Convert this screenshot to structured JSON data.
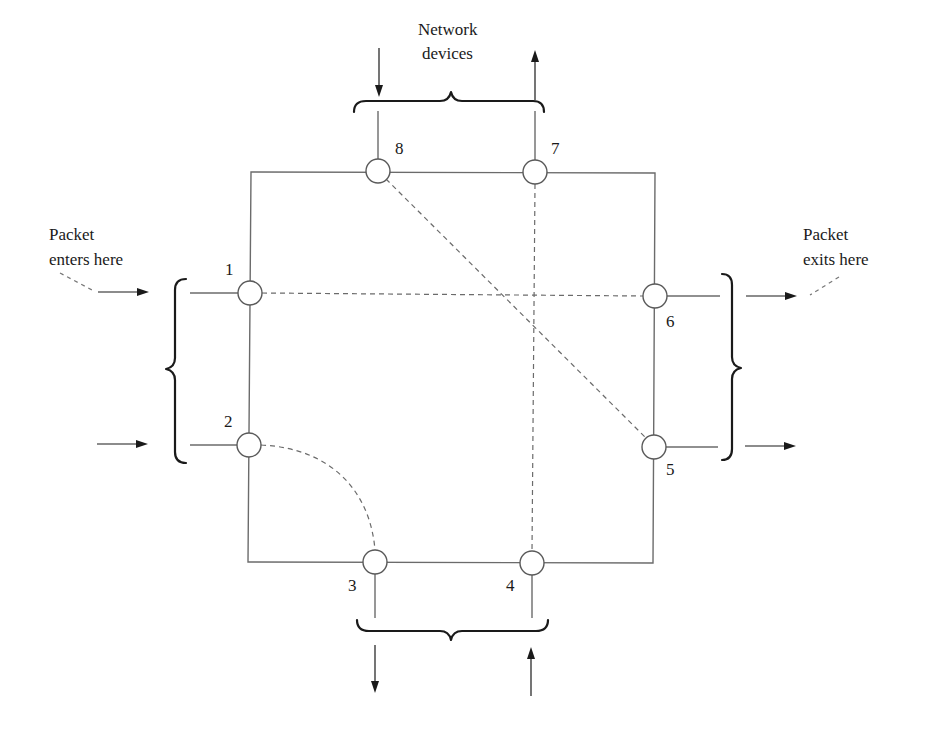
{
  "diagram": {
    "type": "network-routing-square",
    "labels": {
      "top_caption_line1": "Network",
      "top_caption_line2": "devices",
      "enter_line1": "Packet",
      "enter_line2": "enters here",
      "exit_line1": "Packet",
      "exit_line2": "exits here"
    },
    "nodes": [
      {
        "id": "1",
        "label": "1",
        "side": "left",
        "role": "input"
      },
      {
        "id": "2",
        "label": "2",
        "side": "left",
        "role": "input"
      },
      {
        "id": "3",
        "label": "3",
        "side": "bottom",
        "role": "output"
      },
      {
        "id": "4",
        "label": "4",
        "side": "bottom",
        "role": "input"
      },
      {
        "id": "5",
        "label": "5",
        "side": "right",
        "role": "output"
      },
      {
        "id": "6",
        "label": "6",
        "side": "right",
        "role": "output"
      },
      {
        "id": "7",
        "label": "7",
        "side": "top",
        "role": "output"
      },
      {
        "id": "8",
        "label": "8",
        "side": "top",
        "role": "input"
      }
    ],
    "dashed_routes": [
      {
        "from": "1",
        "to": "6",
        "shape": "straight"
      },
      {
        "from": "8",
        "to": "5",
        "shape": "straight"
      },
      {
        "from": "7",
        "to": "4",
        "shape": "straight"
      },
      {
        "from": "2",
        "to": "3",
        "shape": "curve"
      }
    ],
    "colors": {
      "wire": "#6b6b6b",
      "brace": "#1a1a1a",
      "text": "#1a1a1a",
      "background": "#ffffff"
    }
  }
}
